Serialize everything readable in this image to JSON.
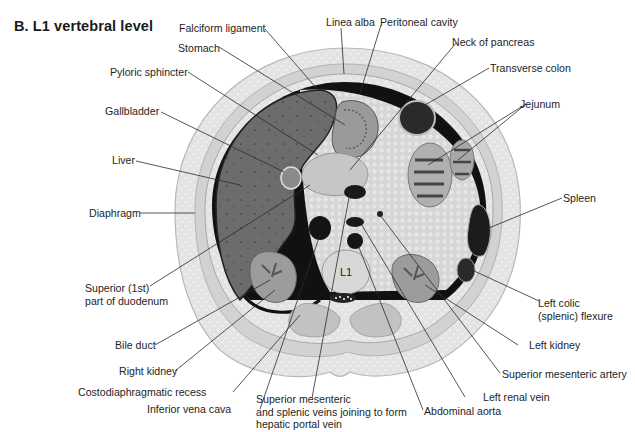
{
  "figure": {
    "title": "B. L1 vertebral level",
    "vertebra_label": "L1",
    "colors": {
      "background": "#ffffff",
      "skin_fat": "#e4e4e4",
      "muscle": "#c9c9c9",
      "liver": "#6e6e6e",
      "organ_dark": "#1c1c1c",
      "viscera_light": "#dcdcdc",
      "leader_line": "#2a2a2a",
      "text": "#1e1e1e"
    }
  },
  "labels": {
    "falciform_ligament": "Falciform ligament",
    "linea_alba": "Linea alba",
    "peritoneal_cavity": "Peritoneal cavity",
    "stomach": "Stomach",
    "neck_of_pancreas": "Neck of pancreas",
    "pyloric_sphincter": "Pyloric sphincter",
    "transverse_colon": "Transverse colon",
    "gallbladder": "Gallbladder",
    "jejunum": "Jejunum",
    "liver": "Liver",
    "diaphragm": "Diaphragm",
    "spleen": "Spleen",
    "superior_duodenum": "Superior (1st)\npart of duodenum",
    "left_colic_flexure": "Left colic\n(splenic) flexure",
    "bile_duct": "Bile duct",
    "left_kidney": "Left kidney",
    "right_kidney": "Right kidney",
    "superior_mesenteric_artery": "Superior mesenteric artery",
    "costodiaphragmatic_recess": "Costodiaphragmatic recess",
    "left_renal_vein": "Left renal vein",
    "inferior_vena_cava": "Inferior vena cava",
    "sm_splenic_veins": "Superior mesenteric\nand splenic veins joining to form\nhepatic portal vein",
    "abdominal_aorta": "Abdominal aorta"
  }
}
